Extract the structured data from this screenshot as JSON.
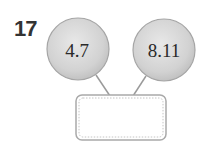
{
  "problem": {
    "number": "17",
    "left_value": "4.7",
    "right_value": "8.11",
    "answer_box": ""
  },
  "colors": {
    "circle_fill": "#d6d6d6",
    "circle_stroke": "#a9a9a9",
    "text": "#2a2a2a"
  }
}
